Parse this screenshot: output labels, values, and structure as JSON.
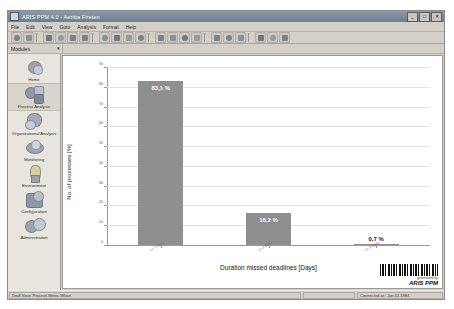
{
  "window": {
    "title": "ARIS PPM 4.0 - Aeritta Fireten",
    "icon": "app-icon",
    "buttons": {
      "minimize": "_",
      "maximize": "□",
      "close": "✕"
    }
  },
  "menubar": {
    "items": [
      "File",
      "Edit",
      "View",
      "Goto",
      "Analysis",
      "Format",
      "Help"
    ]
  },
  "toolbar": {
    "buttons": [
      "new-icon",
      "open-icon",
      "save-icon",
      "print-icon",
      "preview-icon",
      "cut-icon",
      "copy-icon",
      "paste-icon",
      "undo-icon",
      "redo-icon",
      "refresh-icon",
      "filter-icon",
      "chart-icon",
      "table-icon",
      "sort-asc-icon",
      "sort-desc-icon",
      "zoom-icon",
      "grid-icon",
      "export-icon",
      "settings-icon"
    ]
  },
  "modules_bar": {
    "label": "Modules",
    "caret": "▾"
  },
  "sidebar": {
    "items": [
      {
        "label": "Home",
        "icon": "home-icon",
        "selected": false
      },
      {
        "label": "Process Analysis",
        "icon": "process-analysis-icon",
        "selected": true
      },
      {
        "label": "Organizational Analysis",
        "icon": "organizational-analysis-icon",
        "selected": false
      },
      {
        "label": "Monitoring",
        "icon": "monitoring-icon",
        "selected": false
      },
      {
        "label": "Environment",
        "icon": "environment-icon",
        "selected": false
      },
      {
        "label": "Configuration",
        "icon": "configuration-icon",
        "selected": false
      },
      {
        "label": "Administration",
        "icon": "administration-icon",
        "selected": false
      }
    ]
  },
  "brand": {
    "generated_by": "generated by",
    "name": "ARIS PPM",
    "barcode": "barcode-icon"
  },
  "statusbar": {
    "left": "Draft View: Process Metric Whart",
    "middle": "",
    "right": "Connected at : Jan 01 1984"
  },
  "chart_data": {
    "type": "bar",
    "title": "",
    "categories": [
      "<= 1 day",
      "<= 2 days",
      "<= 3 days"
    ],
    "values": [
      83.1,
      16.2,
      0.7
    ],
    "value_labels": [
      "83,1 %",
      "16,2 %",
      "0,7 %"
    ],
    "xlabel": "Duration missed deadlines [Days]",
    "ylabel": "No. of processes [%]",
    "ylim": [
      0,
      90
    ],
    "yticks": [
      0,
      10,
      20,
      30,
      40,
      50,
      60,
      70,
      80,
      90
    ],
    "ytick_labels": [
      "0",
      "10",
      "20",
      "30",
      "40",
      "50",
      "60",
      "70",
      "80",
      "90"
    ],
    "grid": true,
    "legend": false,
    "bar_color": "#8f8f8f",
    "label_inside_color": "#ffffff",
    "label_outside_color": "#1a1a1a"
  }
}
